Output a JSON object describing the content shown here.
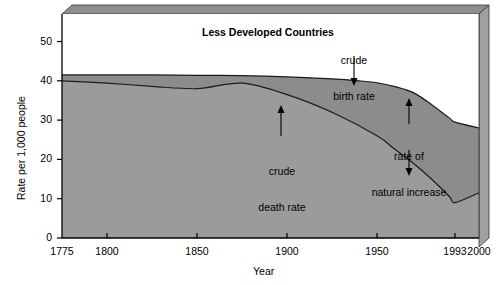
{
  "chart_data": {
    "type": "area",
    "title": "Less Developed Countries",
    "xlabel": "Year",
    "ylabel": "Rate per 1,000 people",
    "xlim": [
      1775,
      2000
    ],
    "ylim": [
      0,
      57
    ],
    "grid": false,
    "legend": "none",
    "xticks": [
      {
        "label": "1775",
        "value": 1775
      },
      {
        "label": "1800",
        "value": 1800
      },
      {
        "label": "1850",
        "value": 1850
      },
      {
        "label": "1900",
        "value": 1900
      },
      {
        "label": "1950",
        "value": 1950
      },
      {
        "label": "1993",
        "value": 1993
      },
      {
        "label": "2000",
        "value": 2000
      }
    ],
    "yticks": [
      {
        "label": "0",
        "value": 0
      },
      {
        "label": "10",
        "value": 10
      },
      {
        "label": "20",
        "value": 20
      },
      {
        "label": "30",
        "value": 30
      },
      {
        "label": "40",
        "value": 40
      },
      {
        "label": "50",
        "value": 50
      }
    ],
    "series": [
      {
        "name": "crude birth rate",
        "x": [
          1775,
          1800,
          1825,
          1850,
          1875,
          1900,
          1925,
          1940,
          1950,
          1960,
          1970,
          1980,
          1990,
          1993,
          2000
        ],
        "values": [
          41.5,
          41.5,
          41.5,
          41.4,
          41.3,
          41.0,
          40.5,
          40.0,
          39.5,
          38.5,
          37.0,
          34.0,
          30.5,
          29.5,
          28.0
        ]
      },
      {
        "name": "crude death rate",
        "x": [
          1775,
          1800,
          1825,
          1850,
          1875,
          1900,
          1925,
          1950,
          1960,
          1970,
          1980,
          1990,
          1993,
          2000
        ],
        "values": [
          40.0,
          39.4,
          38.6,
          38.0,
          39.4,
          36.5,
          32.0,
          26.0,
          22.5,
          19.0,
          15.0,
          10.5,
          9.0,
          11.5
        ]
      }
    ],
    "shaded_band": {
      "name": "rate of natural increase",
      "between": [
        "crude birth rate",
        "crude death rate"
      ]
    },
    "annotations": [
      {
        "name": "crude-birth-rate",
        "lines": [
          "crude",
          "birth rate"
        ],
        "arrow": "down"
      },
      {
        "name": "crude-death-rate",
        "lines": [
          "crude",
          "death rate"
        ],
        "arrow": "up"
      },
      {
        "name": "rate-of-natural-increase",
        "lines": [
          "rate of",
          "natural increase"
        ],
        "arrow": "double-vertical"
      }
    ],
    "colors": {
      "below_death_rate_fill": "#9b9b9b",
      "natural_increase_fill": "#8d8d8d",
      "frame_top": "#8a8a8a",
      "frame_side": "#9a9a9a",
      "line": "#1a1a1a",
      "text": "#000000",
      "background": "#ffffff"
    }
  }
}
